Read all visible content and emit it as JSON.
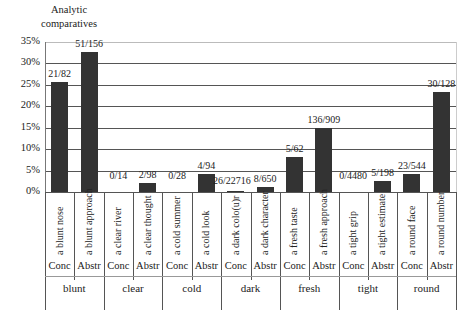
{
  "chart_data": {
    "type": "bar",
    "title": "",
    "ylabel": "Analytic comparatives",
    "xlabel": "",
    "ylim": [
      0,
      35
    ],
    "yticks": [
      "0%",
      "5%",
      "10%",
      "15%",
      "20%",
      "25%",
      "30%",
      "35%"
    ],
    "grid": true,
    "categories": [
      "a blunt nose",
      "a blunt approach",
      "a clear river",
      "a clear thought",
      "a cold summer",
      "a cold look",
      "a dark colo(u)r",
      "a dark character",
      "a fresh taste",
      "a fresh approach",
      "a tight grip",
      "a tight estimate",
      "a round face",
      "a round number"
    ],
    "types": [
      "Conc",
      "Abstr",
      "Conc",
      "Abstr",
      "Conc",
      "Abstr",
      "Conc",
      "Abstr",
      "Conc",
      "Abstr",
      "Conc",
      "Abstr",
      "Conc",
      "Abstr"
    ],
    "groups": [
      "blunt",
      "clear",
      "cold",
      "dark",
      "fresh",
      "tight",
      "round"
    ],
    "values": [
      25.6,
      32.7,
      0,
      2.0,
      0,
      4.3,
      0.1,
      1.2,
      8.1,
      15.0,
      0,
      2.5,
      4.2,
      23.4
    ],
    "data_labels": [
      "21/82",
      "51/156",
      "0/14",
      "2/98",
      "0/28",
      "4/94",
      "26/22716",
      "8/650",
      "5/62",
      "136/909",
      "0/4480",
      "5/198",
      "23/544",
      "30/128"
    ],
    "bar_color": "#333333"
  }
}
